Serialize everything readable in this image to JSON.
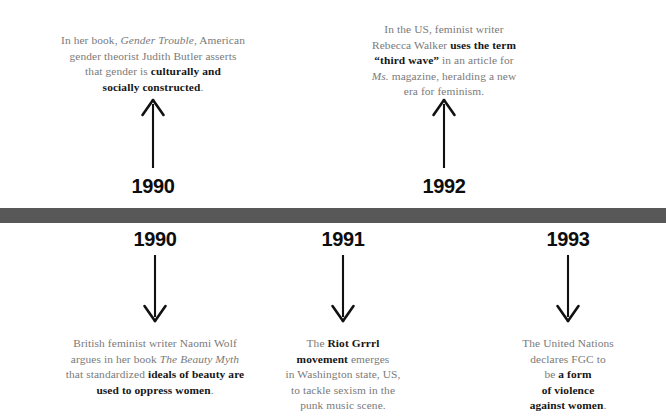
{
  "page": {
    "background_color": "#ffffff",
    "bar_color": "#585858",
    "body_text_color": "#7a7a7a",
    "emphasis_text_color": "#161616",
    "year_text_color": "#0d0d0d"
  },
  "events": [
    {
      "id": "1990-butler",
      "year": "1990",
      "position": "above",
      "arrow": "arrow-up",
      "lines": [
        [
          {
            "text": "In her book, ",
            "style": "regular"
          },
          {
            "text": "Gender Trouble",
            "style": "italic"
          },
          {
            "text": ", American",
            "style": "regular"
          }
        ],
        [
          {
            "text": "gender theorist Judith Butler asserts",
            "style": "regular"
          }
        ],
        [
          {
            "text": "that gender is ",
            "style": "regular"
          },
          {
            "text": "culturally and",
            "style": "bold"
          }
        ],
        [
          {
            "text": "socially constructed",
            "style": "bold"
          },
          {
            "text": ".",
            "style": "regular"
          }
        ]
      ],
      "plain_text": "In her book, Gender Trouble, American gender theorist Judith Butler asserts that gender is culturally and socially constructed."
    },
    {
      "id": "1992-walker",
      "year": "1992",
      "position": "above",
      "arrow": "arrow-up",
      "lines": [
        [
          {
            "text": "In the US, feminist writer",
            "style": "regular"
          }
        ],
        [
          {
            "text": "Rebecca Walker ",
            "style": "regular"
          },
          {
            "text": "uses the term",
            "style": "bold"
          }
        ],
        [
          {
            "text": "“third wave”",
            "style": "bold"
          },
          {
            "text": " in an article for",
            "style": "regular"
          }
        ],
        [
          {
            "text": "Ms.",
            "style": "italic"
          },
          {
            "text": " magazine, heralding a new",
            "style": "regular"
          }
        ],
        [
          {
            "text": "era for feminism.",
            "style": "regular"
          }
        ]
      ],
      "plain_text": "In the US, feminist writer Rebecca Walker uses the term “third wave” in an article for Ms. magazine, heralding a new era for feminism."
    },
    {
      "id": "1990-wolf",
      "year": "1990",
      "position": "below",
      "arrow": "arrow-down",
      "lines": [
        [
          {
            "text": "British feminist writer Naomi Wolf",
            "style": "regular"
          }
        ],
        [
          {
            "text": "argues in her book ",
            "style": "regular"
          },
          {
            "text": "The Beauty Myth",
            "style": "italic"
          }
        ],
        [
          {
            "text": "that standardized ",
            "style": "regular"
          },
          {
            "text": "ideals of beauty are",
            "style": "bold"
          }
        ],
        [
          {
            "text": "used to oppress women",
            "style": "bold"
          },
          {
            "text": ".",
            "style": "regular"
          }
        ]
      ],
      "plain_text": "British feminist writer Naomi Wolf argues in her book The Beauty Myth that standardized ideals of beauty are used to oppress women."
    },
    {
      "id": "1991-riot-grrrl",
      "year": "1991",
      "position": "below",
      "arrow": "arrow-down",
      "lines": [
        [
          {
            "text": "The ",
            "style": "regular"
          },
          {
            "text": "Riot Grrrl",
            "style": "bold"
          }
        ],
        [
          {
            "text": "movement",
            "style": "bold"
          },
          {
            "text": " emerges",
            "style": "regular"
          }
        ],
        [
          {
            "text": "in Washington state, US,",
            "style": "regular"
          }
        ],
        [
          {
            "text": "to tackle sexism in the",
            "style": "regular"
          }
        ],
        [
          {
            "text": "punk music scene.",
            "style": "regular"
          }
        ]
      ],
      "plain_text": "The Riot Grrrl movement emerges in Washington state, US, to tackle sexism in the punk music scene."
    },
    {
      "id": "1993-un-fgc",
      "year": "1993",
      "position": "below",
      "arrow": "arrow-down",
      "lines": [
        [
          {
            "text": "The United Nations",
            "style": "regular"
          }
        ],
        [
          {
            "text": "declares FGC to",
            "style": "regular"
          }
        ],
        [
          {
            "text": "be ",
            "style": "regular"
          },
          {
            "text": "a form",
            "style": "bold"
          }
        ],
        [
          {
            "text": "of violence",
            "style": "bold"
          }
        ],
        [
          {
            "text": "against women",
            "style": "bold"
          },
          {
            "text": ".",
            "style": "regular"
          }
        ]
      ],
      "plain_text": "The United Nations declares FGC to be a form of violence against women."
    }
  ]
}
